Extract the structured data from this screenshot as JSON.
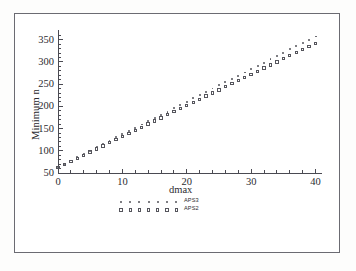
{
  "figure": {
    "background_color": "#ffffff",
    "frame_color": "#6b6b72",
    "axis_color": "#4a4a52",
    "marker_color": "#55555c"
  },
  "chart_data": {
    "type": "scatter",
    "title": "",
    "xlabel": "dmax",
    "ylabel": "Minimum n",
    "xlim": [
      0,
      41
    ],
    "ylim": [
      50,
      365
    ],
    "grid": false,
    "legend_position": "below-axis",
    "xticks": [
      0,
      10,
      20,
      30,
      40
    ],
    "xtick_labels": [
      "0",
      "10",
      "20",
      "30",
      "40"
    ],
    "yticks": [
      50,
      100,
      150,
      200,
      250,
      300,
      350
    ],
    "ytick_labels": [
      "50",
      "100",
      "150",
      "200",
      "250",
      "300",
      "350"
    ],
    "x_minor_tick_step": 2,
    "y_minor_tick_step": 10,
    "x": [
      0,
      1,
      2,
      3,
      4,
      5,
      6,
      7,
      8,
      9,
      10,
      11,
      12,
      13,
      14,
      15,
      16,
      17,
      18,
      19,
      20,
      21,
      22,
      23,
      24,
      25,
      26,
      27,
      28,
      29,
      30,
      31,
      32,
      33,
      34,
      35,
      36,
      37,
      38,
      39,
      40
    ],
    "series": [
      {
        "name": "APS3",
        "marker": "dot",
        "values": [
          62,
          71,
          78,
          86,
          93,
          100,
          108,
          115,
          122,
          130,
          137,
          144,
          152,
          159,
          166,
          174,
          181,
          188,
          196,
          203,
          210,
          218,
          225,
          232,
          240,
          247,
          254,
          262,
          269,
          276,
          284,
          291,
          298,
          306,
          313,
          320,
          328,
          335,
          342,
          350,
          357
        ]
      },
      {
        "name": "APS2",
        "marker": "open-square",
        "values": [
          62,
          69,
          76,
          83,
          90,
          97,
          104,
          111,
          118,
          125,
          132,
          139,
          146,
          153,
          160,
          167,
          174,
          181,
          188,
          195,
          202,
          209,
          216,
          223,
          230,
          237,
          244,
          251,
          258,
          265,
          272,
          279,
          286,
          293,
          300,
          307,
          314,
          321,
          328,
          335,
          342
        ]
      }
    ]
  },
  "legend": {
    "entries": [
      {
        "label": "APS3",
        "marker": "dot"
      },
      {
        "label": "APS2",
        "marker": "open-square"
      }
    ]
  }
}
